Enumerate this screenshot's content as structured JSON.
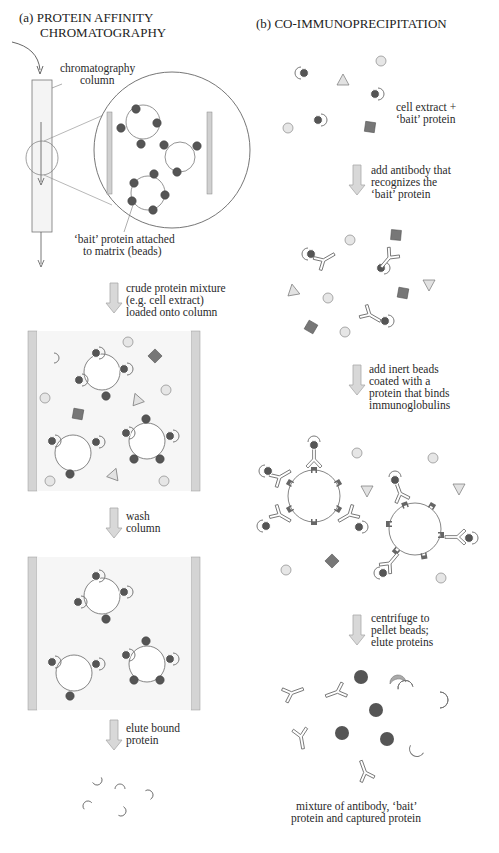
{
  "panel_a": {
    "title_line1": "(a) PROTEIN AFFINITY",
    "title_line2": "CHROMATOGRAPHY",
    "column_label_line1": "chromatography",
    "column_label_line2": "column",
    "bait_label_line1": "‘bait’ protein attached",
    "bait_label_line2": "to matrix (beads)",
    "step1_line1": "crude protein mixture",
    "step1_line2": "(e.g. cell extract)",
    "step1_line3": "loaded onto column",
    "step2_line1": "wash",
    "step2_line2": "column",
    "step3_line1": "elute bound",
    "step3_line2": "protein"
  },
  "panel_b": {
    "title": "(b) CO-IMMUNOPRECIPITATION",
    "start_label_line1": "cell extract +",
    "start_label_line2": "‘bait’ protein",
    "step1_line1": "add antibody that",
    "step1_line2": "recognizes the",
    "step1_line3": "‘bait’ protein",
    "step2_line1": "add inert beads",
    "step2_line2": "coated with a",
    "step2_line3": "protein that binds",
    "step2_line4": "immunoglobulins",
    "step3_line1": "centrifuge to",
    "step3_line2": "pellet beads;",
    "step3_line3": "elute proteins",
    "result_line1": "mixture of antibody, ‘bait’",
    "result_line2": "protein and captured protein"
  },
  "colors": {
    "bait_protein": "#555555",
    "captured_protein": "#a9a9a9",
    "other_circle": "#e4e4e4",
    "square_protein": "#777777",
    "triangle_protein": "#e0e0e0",
    "column_wall": "#d0d0d0",
    "arrow_fill": "#d8d8d8",
    "outline": "#666666"
  }
}
